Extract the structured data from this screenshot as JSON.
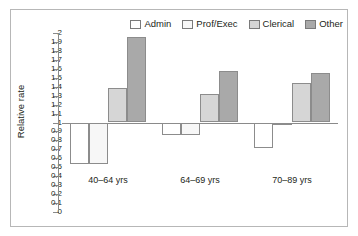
{
  "chart_data": {
    "type": "bar",
    "title": "",
    "xlabel": "",
    "ylabel": "Relative rate",
    "categories": [
      "40–64 yrs",
      "64–69 yrs",
      "70–89 yrs"
    ],
    "series": [
      {
        "name": "Admin",
        "values": [
          0.54,
          0.86,
          0.72
        ],
        "color": "#ffffff"
      },
      {
        "name": "Prof/Exec",
        "values": [
          0.54,
          0.86,
          0.98
        ],
        "color": "#f7f7f7"
      },
      {
        "name": "Clerical",
        "values": [
          1.39,
          1.32,
          1.44
        ],
        "color": "#d6d6d6"
      },
      {
        "name": "Other",
        "values": [
          1.95,
          1.58,
          1.55
        ],
        "color": "#a9a9a9"
      }
    ],
    "baseline": 1,
    "ylim": [
      0,
      2
    ],
    "ytick_labels": [
      "2",
      "1.9",
      "1.8",
      "1.7",
      "1.6",
      "1.5",
      "1.4",
      "1.3",
      "1.2",
      "1.1",
      "1",
      "0.9",
      "0.8",
      "0.7",
      "0.6",
      "0.5",
      "0.4",
      "0.3",
      "0.2",
      "0.1",
      "0"
    ],
    "ytick_values": [
      2,
      1.9,
      1.8,
      1.7,
      1.6,
      1.5,
      1.4,
      1.3,
      1.2,
      1.1,
      1,
      0.9,
      0.8,
      0.7,
      0.6,
      0.5,
      0.4,
      0.3,
      0.2,
      0.1,
      0
    ],
    "grid": false,
    "legend_position": "top-right"
  },
  "legend": {
    "entries": [
      {
        "label": "Admin"
      },
      {
        "label": "Prof/Exec"
      },
      {
        "label": "Clerical"
      },
      {
        "label": "Other"
      }
    ]
  },
  "axes": {
    "y_title": "Relative rate"
  }
}
